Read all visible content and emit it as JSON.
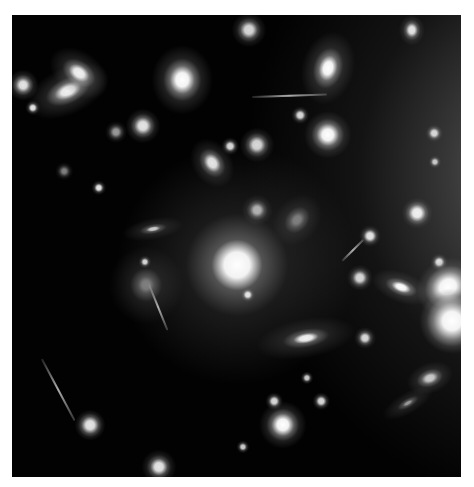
{
  "image": {
    "subject": "galaxy cluster",
    "width": 449,
    "height": 462,
    "background_color": "#020202",
    "border_color": "#ffffff"
  },
  "galaxies": [
    {
      "x": 225,
      "y": 250,
      "w": 110,
      "h": 110,
      "core": 18,
      "rot": -30,
      "bright": 1.0,
      "glow": 0.45
    },
    {
      "x": 56,
      "y": 76,
      "w": 40,
      "h": 22,
      "core": 10,
      "rot": -25,
      "bright": 0.95,
      "glow": 0.55
    },
    {
      "x": 67,
      "y": 58,
      "w": 30,
      "h": 20,
      "core": 8,
      "rot": 35,
      "bright": 0.95,
      "glow": 0.5
    },
    {
      "x": 11,
      "y": 70,
      "w": 14,
      "h": 14,
      "core": 5,
      "rot": 0,
      "bright": 0.9,
      "glow": 0.5
    },
    {
      "x": 170,
      "y": 65,
      "w": 28,
      "h": 32,
      "core": 10,
      "rot": 0,
      "bright": 1.0,
      "glow": 0.55
    },
    {
      "x": 237,
      "y": 15,
      "w": 16,
      "h": 16,
      "core": 6,
      "rot": 0,
      "bright": 0.85,
      "glow": 0.4
    },
    {
      "x": 316,
      "y": 53,
      "w": 24,
      "h": 34,
      "core": 9,
      "rot": 15,
      "bright": 1.0,
      "glow": 0.55
    },
    {
      "x": 400,
      "y": 15,
      "w": 12,
      "h": 14,
      "core": 5,
      "rot": 0,
      "bright": 0.9,
      "glow": 0.4
    },
    {
      "x": 131,
      "y": 111,
      "w": 16,
      "h": 16,
      "core": 6,
      "rot": 0,
      "bright": 0.9,
      "glow": 0.45
    },
    {
      "x": 316,
      "y": 120,
      "w": 22,
      "h": 22,
      "core": 8,
      "rot": 0,
      "bright": 1.0,
      "glow": 0.5
    },
    {
      "x": 245,
      "y": 130,
      "w": 16,
      "h": 16,
      "core": 6,
      "rot": 0,
      "bright": 0.85,
      "glow": 0.4
    },
    {
      "x": 200,
      "y": 148,
      "w": 18,
      "h": 24,
      "core": 7,
      "rot": -35,
      "bright": 0.9,
      "glow": 0.45
    },
    {
      "x": 218,
      "y": 131,
      "w": 8,
      "h": 8,
      "core": 4,
      "rot": 0,
      "bright": 0.85,
      "glow": 0.3
    },
    {
      "x": 87,
      "y": 173,
      "w": 7,
      "h": 7,
      "core": 4,
      "rot": 0,
      "bright": 0.9,
      "glow": 0.3
    },
    {
      "x": 21,
      "y": 93,
      "w": 7,
      "h": 7,
      "core": 4,
      "rot": 0,
      "bright": 0.9,
      "glow": 0.3
    },
    {
      "x": 141,
      "y": 214,
      "w": 28,
      "h": 10,
      "core": 5,
      "rot": -10,
      "bright": 0.8,
      "glow": 0.4
    },
    {
      "x": 285,
      "y": 205,
      "w": 20,
      "h": 26,
      "core": 6,
      "rot": 40,
      "bright": 0.5,
      "glow": 0.35
    },
    {
      "x": 245,
      "y": 195,
      "w": 14,
      "h": 14,
      "core": 5,
      "rot": 0,
      "bright": 0.7,
      "glow": 0.35
    },
    {
      "x": 405,
      "y": 198,
      "w": 14,
      "h": 14,
      "core": 6,
      "rot": 0,
      "bright": 0.95,
      "glow": 0.4
    },
    {
      "x": 422,
      "y": 118,
      "w": 8,
      "h": 8,
      "core": 4,
      "rot": 0,
      "bright": 0.85,
      "glow": 0.3
    },
    {
      "x": 358,
      "y": 221,
      "w": 10,
      "h": 10,
      "core": 5,
      "rot": 0,
      "bright": 0.9,
      "glow": 0.3
    },
    {
      "x": 427,
      "y": 247,
      "w": 8,
      "h": 8,
      "core": 4,
      "rot": 0,
      "bright": 0.9,
      "glow": 0.3
    },
    {
      "x": 389,
      "y": 272,
      "w": 28,
      "h": 14,
      "core": 7,
      "rot": 20,
      "bright": 1.0,
      "glow": 0.5
    },
    {
      "x": 436,
      "y": 272,
      "w": 30,
      "h": 26,
      "core": 12,
      "rot": -30,
      "bright": 1.0,
      "glow": 0.6
    },
    {
      "x": 440,
      "y": 306,
      "w": 30,
      "h": 30,
      "core": 14,
      "rot": 0,
      "bright": 1.0,
      "glow": 0.6
    },
    {
      "x": 348,
      "y": 263,
      "w": 12,
      "h": 12,
      "core": 5,
      "rot": 0,
      "bright": 0.85,
      "glow": 0.35
    },
    {
      "x": 294,
      "y": 323,
      "w": 46,
      "h": 18,
      "core": 9,
      "rot": -10,
      "bright": 0.95,
      "glow": 0.45
    },
    {
      "x": 353,
      "y": 323,
      "w": 10,
      "h": 10,
      "core": 4,
      "rot": 0,
      "bright": 0.85,
      "glow": 0.35
    },
    {
      "x": 236,
      "y": 280,
      "w": 7,
      "h": 7,
      "core": 4,
      "rot": 0,
      "bright": 0.9,
      "glow": 0.3
    },
    {
      "x": 134,
      "y": 270,
      "w": 34,
      "h": 36,
      "core": 6,
      "rot": 0,
      "bright": 0.5,
      "glow": 0.4
    },
    {
      "x": 133,
      "y": 247,
      "w": 6,
      "h": 6,
      "core": 3,
      "rot": 0,
      "bright": 0.85,
      "glow": 0.3
    },
    {
      "x": 271,
      "y": 410,
      "w": 22,
      "h": 22,
      "core": 8,
      "rot": 0,
      "bright": 1.0,
      "glow": 0.5
    },
    {
      "x": 262,
      "y": 386,
      "w": 8,
      "h": 8,
      "core": 4,
      "rot": 0,
      "bright": 0.85,
      "glow": 0.3
    },
    {
      "x": 309,
      "y": 386,
      "w": 8,
      "h": 8,
      "core": 4,
      "rot": 0,
      "bright": 0.85,
      "glow": 0.3
    },
    {
      "x": 295,
      "y": 363,
      "w": 6,
      "h": 6,
      "core": 3,
      "rot": 0,
      "bright": 0.8,
      "glow": 0.3
    },
    {
      "x": 78,
      "y": 410,
      "w": 14,
      "h": 14,
      "core": 6,
      "rot": 0,
      "bright": 0.9,
      "glow": 0.4
    },
    {
      "x": 147,
      "y": 452,
      "w": 16,
      "h": 16,
      "core": 6,
      "rot": 0,
      "bright": 0.9,
      "glow": 0.4
    },
    {
      "x": 231,
      "y": 432,
      "w": 6,
      "h": 6,
      "core": 3,
      "rot": 0,
      "bright": 0.8,
      "glow": 0.3
    },
    {
      "x": 418,
      "y": 363,
      "w": 22,
      "h": 14,
      "core": 6,
      "rot": -20,
      "bright": 0.8,
      "glow": 0.45
    },
    {
      "x": 396,
      "y": 388,
      "w": 26,
      "h": 10,
      "core": 4,
      "rot": -30,
      "bright": 0.6,
      "glow": 0.4
    },
    {
      "x": 423,
      "y": 147,
      "w": 6,
      "h": 6,
      "core": 3,
      "rot": 0,
      "bright": 0.8,
      "glow": 0.3
    },
    {
      "x": 104,
      "y": 117,
      "w": 10,
      "h": 10,
      "core": 4,
      "rot": 0,
      "bright": 0.6,
      "glow": 0.3
    },
    {
      "x": 52,
      "y": 156,
      "w": 8,
      "h": 8,
      "core": 3,
      "rot": 0,
      "bright": 0.5,
      "glow": 0.3
    },
    {
      "x": 288,
      "y": 100,
      "w": 8,
      "h": 8,
      "core": 4,
      "rot": 0,
      "bright": 0.85,
      "glow": 0.3
    }
  ],
  "arcs": [
    {
      "x": 30,
      "y": 343,
      "len": 70,
      "rot": 62
    },
    {
      "x": 137,
      "y": 268,
      "len": 50,
      "rot": 68
    },
    {
      "x": 240,
      "y": 81,
      "len": 75,
      "rot": -2
    },
    {
      "x": 330,
      "y": 245,
      "len": 30,
      "rot": -45
    }
  ]
}
